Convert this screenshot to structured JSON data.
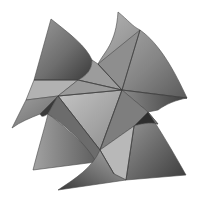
{
  "figure": {
    "title": "",
    "background": "#ffffff",
    "palette": {
      "darkest": "#2e2e2e",
      "dark": "#5a5a5a",
      "mid": "#808080",
      "light": "#a8a8a8",
      "lightest": "#c8c8c8",
      "edge": "#3c3c3c"
    }
  }
}
